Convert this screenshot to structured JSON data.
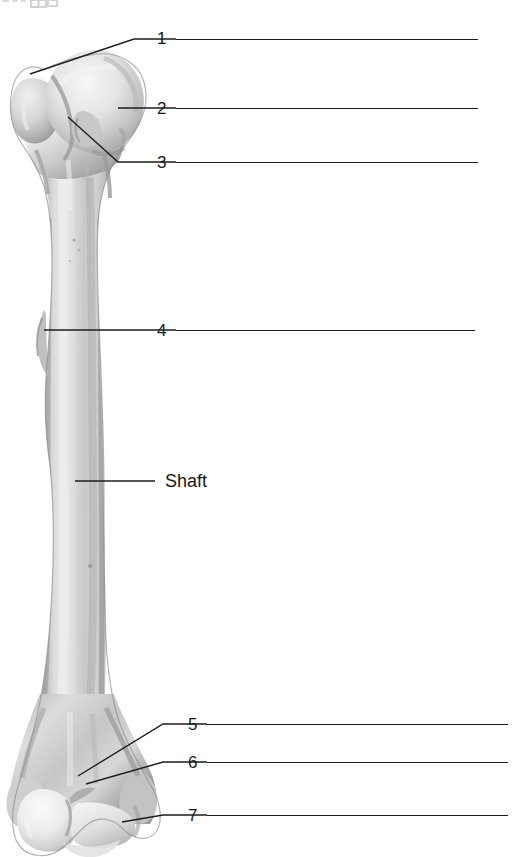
{
  "figure": {
    "bone_name": "humerus",
    "view": "anterior",
    "background_color": "#ffffff",
    "line_color": "#1d1d1d",
    "text_color": "#181818"
  },
  "labels": [
    {
      "id": "1",
      "text": "1",
      "type": "number",
      "x": 157,
      "y": 30,
      "rule_x1": 176,
      "rule_x2": 478,
      "rule_y": 39,
      "leader": "M 30 74 L 134 39 L 176 39"
    },
    {
      "id": "2",
      "text": "2",
      "type": "number",
      "x": 157,
      "y": 100,
      "rule_x1": 176,
      "rule_x2": 478,
      "rule_y": 108,
      "leader": "M 118 108 L 176 108"
    },
    {
      "id": "3",
      "text": "3",
      "type": "number",
      "x": 157,
      "y": 154,
      "rule_x1": 176,
      "rule_x2": 478,
      "rule_y": 162,
      "leader": "M 68 117 L 118 162 L 176 162"
    },
    {
      "id": "4",
      "text": "4",
      "type": "number",
      "x": 157,
      "y": 322,
      "rule_x1": 176,
      "rule_x2": 475,
      "rule_y": 330,
      "leader": "M 44 330 L 176 330"
    },
    {
      "id": "shaft",
      "text": "Shaft",
      "type": "word",
      "x": 165,
      "y": 472,
      "rule_x1": 0,
      "rule_x2": 0,
      "rule_y": 0,
      "leader": "M 75 481 L 155 481"
    },
    {
      "id": "5",
      "text": "5",
      "type": "number",
      "x": 188,
      "y": 716,
      "rule_x1": 207,
      "rule_x2": 508,
      "rule_y": 724,
      "leader": "M 78 776 L 163 724 L 207 724"
    },
    {
      "id": "6",
      "text": "6",
      "type": "number",
      "x": 188,
      "y": 754,
      "rule_x1": 207,
      "rule_x2": 508,
      "rule_y": 762,
      "leader": "M 86 784 L 163 762 L 207 762"
    },
    {
      "id": "7",
      "text": "7",
      "type": "number",
      "x": 188,
      "y": 807,
      "rule_x1": 207,
      "rule_x2": 508,
      "rule_y": 815,
      "leader": "M 122 822 L 163 815 L 207 815"
    }
  ]
}
